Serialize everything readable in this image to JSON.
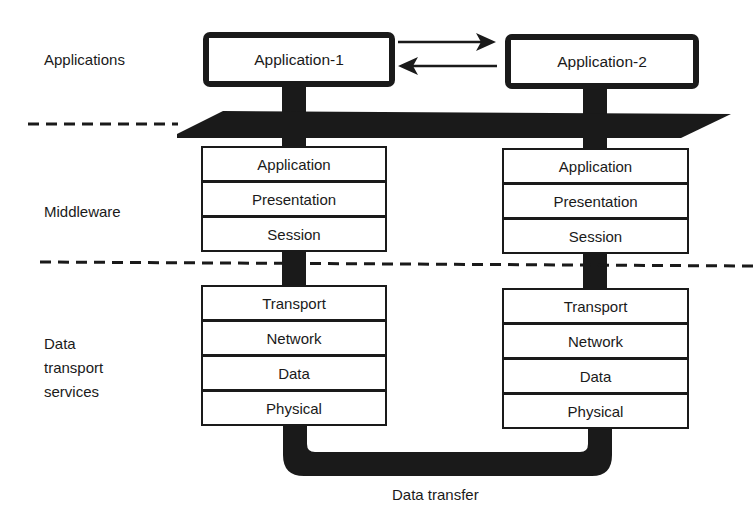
{
  "diagram": {
    "categories": {
      "applications": "Applications",
      "middleware": "Middleware",
      "data_transport": [
        "Data",
        "transport",
        "services"
      ]
    },
    "applications": [
      {
        "label": "Application-1"
      },
      {
        "label": "Application-2"
      }
    ],
    "arrows": [
      {
        "from": "Application-1",
        "to": "Application-2",
        "direction": "right"
      },
      {
        "from": "Application-2",
        "to": "Application-1",
        "direction": "left"
      }
    ],
    "middleware_layers": [
      "Application",
      "Presentation",
      "Session"
    ],
    "transport_layers": [
      "Transport",
      "Network",
      "Data",
      "Physical"
    ],
    "bottom_caption": "Data transfer",
    "colors": {
      "ink": "#1a1a1a",
      "background": "#ffffff"
    }
  }
}
